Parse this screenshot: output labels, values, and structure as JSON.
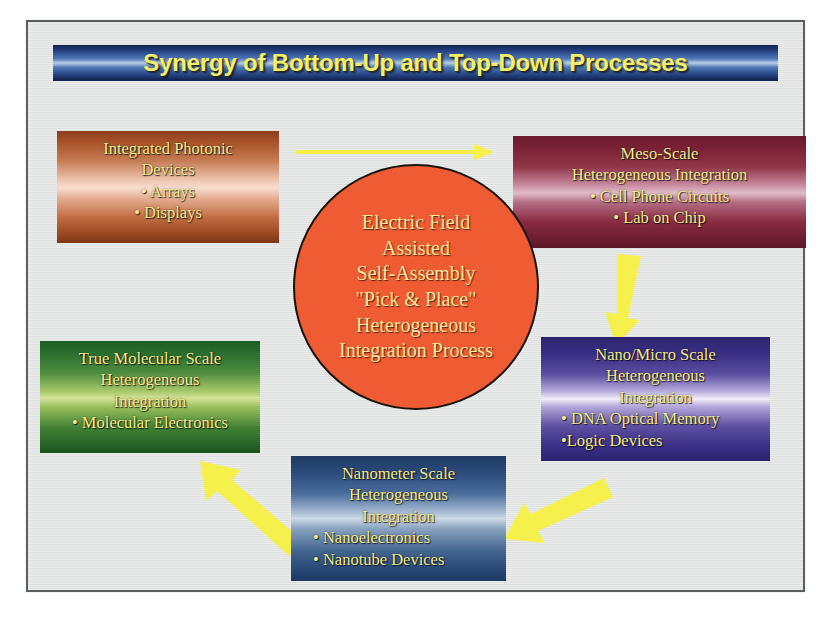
{
  "slide": {
    "title": "Synergy of Bottom-Up and Top-Down Processes",
    "background_color": "#e2e4e4",
    "frame_border_color": "#5a5e5e",
    "title_text_color": "#f4f06a",
    "arrow_color": "#f7f24a"
  },
  "center": {
    "name": "electric-field-assisted-self-assembly",
    "shape": "circle",
    "fill_color": "#ef5b32",
    "text_color": "#fbe9a0",
    "lines": [
      "Electric Field",
      "Assisted",
      "Self-Assembly",
      "\"Pick & Place\"",
      "Heterogeneous",
      "Integration Process"
    ]
  },
  "nodes": [
    {
      "id": "photonic",
      "position": "top-left",
      "accent_color": "#a85228",
      "heading": [
        "Integrated Photonic",
        "Devices"
      ],
      "bullets": [
        "• Arrays",
        "• Displays"
      ]
    },
    {
      "id": "meso",
      "position": "top-right",
      "accent_color": "#7c2236",
      "heading": [
        "Meso-Scale",
        "Heterogeneous Integration"
      ],
      "bullets": [
        "• Cell Phone Circuits",
        "• Lab on Chip"
      ]
    },
    {
      "id": "molecular",
      "position": "left-middle",
      "accent_color": "#2c7030",
      "heading": [
        "True Molecular Scale",
        "Heterogeneous",
        "Integration"
      ],
      "bullets": [
        "• Molecular Electronics"
      ]
    },
    {
      "id": "nanomicro",
      "position": "right-middle",
      "accent_color": "#3a2f84",
      "heading": [
        "Nano/Micro Scale",
        "Heterogeneous",
        "Integration"
      ],
      "bullets": [
        "• DNA Optical Memory",
        "•Logic Devices"
      ]
    },
    {
      "id": "nanometer",
      "position": "bottom-center",
      "accent_color": "#2b4c7c",
      "heading": [
        "Nanometer Scale",
        "Heterogeneous",
        "Integration"
      ],
      "bullets": [
        "• Nanoelectronics",
        "• Nanotube Devices"
      ]
    }
  ],
  "arrows": [
    {
      "id": "photonic-to-meso",
      "from": "photonic",
      "to": "meso",
      "style": "thin",
      "direction": "right"
    },
    {
      "id": "meso-to-nanomicro",
      "from": "meso",
      "to": "nanomicro",
      "style": "thick",
      "direction": "down"
    },
    {
      "id": "nanomicro-to-nanometer",
      "from": "nanomicro",
      "to": "nanometer",
      "style": "thick",
      "direction": "down-left"
    },
    {
      "id": "nanometer-to-molecular",
      "from": "nanometer",
      "to": "molecular",
      "style": "thick",
      "direction": "up-left"
    }
  ]
}
